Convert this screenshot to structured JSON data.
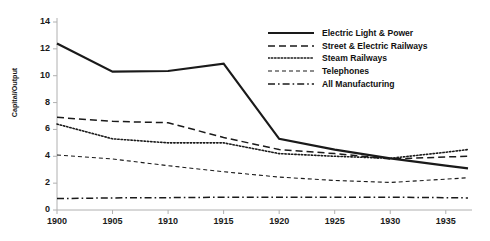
{
  "chart_data": {
    "type": "line",
    "title": "",
    "xlabel": "",
    "ylabel": "Capital/Output",
    "xlim": [
      1900,
      1937
    ],
    "ylim": [
      0,
      14
    ],
    "yticks": [
      0,
      2,
      4,
      6,
      8,
      10,
      12,
      14
    ],
    "xticks": [
      1900,
      1905,
      1910,
      1915,
      1920,
      1925,
      1930,
      1935
    ],
    "grid": false,
    "legend_position": "upper right",
    "x": [
      1900,
      1905,
      1910,
      1915,
      1920,
      1925,
      1930,
      1935,
      1937
    ],
    "series": [
      {
        "name": "Electric Light & Power",
        "style": "solid",
        "color": "#1a1a1a",
        "values": [
          12.4,
          10.3,
          10.35,
          10.9,
          5.3,
          4.5,
          3.85,
          3.3,
          3.1
        ]
      },
      {
        "name": "Street & Electric Railways",
        "style": "dashed",
        "color": "#1a1a1a",
        "values": [
          6.9,
          6.6,
          6.5,
          5.4,
          4.5,
          4.2,
          3.8,
          3.95,
          4.0
        ]
      },
      {
        "name": "Steam Railways",
        "style": "dotted",
        "color": "#1a1a1a",
        "values": [
          6.4,
          5.3,
          5.0,
          5.0,
          4.2,
          4.0,
          3.85,
          4.3,
          4.5
        ]
      },
      {
        "name": "Telephones",
        "style": "finedashed",
        "color": "#1a1a1a",
        "values": [
          4.1,
          3.8,
          3.3,
          2.85,
          2.45,
          2.2,
          2.05,
          2.3,
          2.4
        ]
      },
      {
        "name": "All Manufacturing",
        "style": "dashdot",
        "color": "#1a1a1a",
        "values": [
          0.85,
          0.9,
          0.92,
          0.95,
          0.95,
          0.95,
          0.95,
          0.92,
          0.9
        ]
      }
    ]
  },
  "axis": {
    "ylabel": "Capital/Output",
    "ytick_labels": [
      "0",
      "2",
      "4",
      "6",
      "8",
      "10",
      "12",
      "14"
    ],
    "xtick_labels": [
      "1900",
      "1905",
      "1910",
      "1915",
      "1920",
      "1925",
      "1930",
      "1935"
    ],
    "axis_color": "#b0b0b0"
  },
  "legend": {
    "items": [
      {
        "label": "Electric Light & Power"
      },
      {
        "label": "Street & Electric Railways"
      },
      {
        "label": "Steam Railways"
      },
      {
        "label": "Telephones"
      },
      {
        "label": "All Manufacturing"
      }
    ]
  }
}
